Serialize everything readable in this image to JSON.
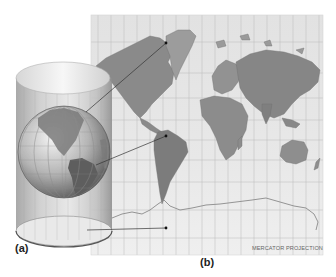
{
  "figure": {
    "panel_a_label": "(a)",
    "panel_b_label": "(b)",
    "projection_label": "MERCATOR PROJECTION"
  },
  "panels": [
    {
      "id": "a",
      "content": "Globe inside a transparent cylinder"
    },
    {
      "id": "b",
      "content": "World map with latitude/longitude grid"
    }
  ],
  "connectors": [
    {
      "from": "globe-north",
      "to": "map-greenland-point"
    },
    {
      "from": "globe-south-america",
      "to": "map-south-america-point"
    },
    {
      "from": "cylinder-base",
      "to": "map-antarctica-point"
    }
  ],
  "colors": {
    "map_background": "#e6e6e6",
    "grid": "#b9b9b9",
    "land": "#8f8f8f",
    "cylinder": "#cfcfcf",
    "connector": "#333333"
  }
}
